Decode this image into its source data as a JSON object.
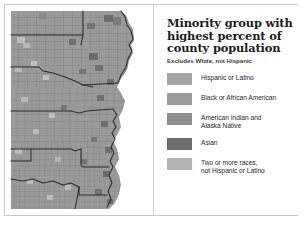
{
  "figure": {
    "type": "choropleth-map",
    "region": "United States — central states (Upper Midwest, Great Plains, Mississippi Valley)"
  },
  "legend": {
    "title_lines": [
      "Minority group with",
      "highest percent of",
      "county population"
    ],
    "subtitle": "Excludes White, not Hispanic",
    "items": [
      {
        "label_lines": [
          "Hispanic or Latino"
        ],
        "color": "#a3a3a3"
      },
      {
        "label_lines": [
          "Black or African American"
        ],
        "color": "#9b9b9b"
      },
      {
        "label_lines": [
          "American Indian and",
          "Alaska Native"
        ],
        "color": "#8d8d8d"
      },
      {
        "label_lines": [
          "Asian"
        ],
        "color": "#6e6e6e"
      },
      {
        "label_lines": [
          "Two or more races,",
          "not Hispanic or Latino"
        ],
        "color": "#b4b4b4"
      }
    ]
  },
  "map": {
    "base_fill": "#9a9a9a",
    "county_line_color": "#7a7a7a",
    "state_line_color": "#2b2b2b",
    "patch_colors": {
      "dark": "#6d6d6d",
      "mid_dark": "#868686",
      "light": "#b6b6b6",
      "very_light": "#c4c4c4"
    }
  }
}
